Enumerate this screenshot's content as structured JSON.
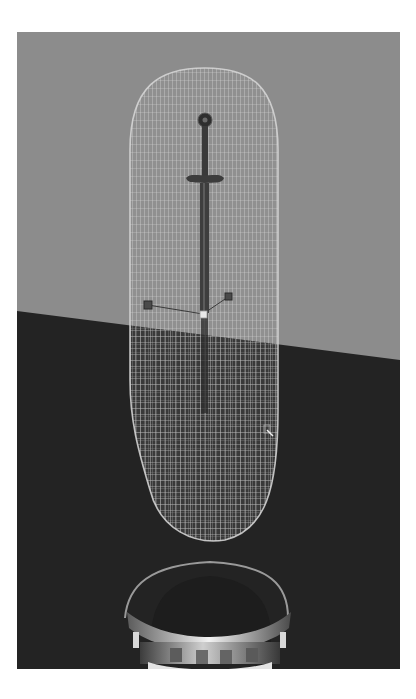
{
  "viewport": {
    "label": "3D viewport - sword in capsule collider above pedestal",
    "colors": {
      "wall": "#8c8c8c",
      "floor": "#232323",
      "wireframe": "#cfcfcf",
      "sword": "#3c3c3c",
      "handle_line": "#3a3a3a",
      "pedestal_light": "#e6e6e6",
      "pedestal_dark": "#3a3a3a",
      "page_bg": "#ffffff"
    },
    "objects": [
      {
        "name": "capsule-wireframe",
        "type": "collider"
      },
      {
        "name": "sword",
        "type": "mesh"
      },
      {
        "name": "transform-handles",
        "type": "manipulator"
      },
      {
        "name": "pedestal",
        "type": "mesh"
      }
    ]
  }
}
